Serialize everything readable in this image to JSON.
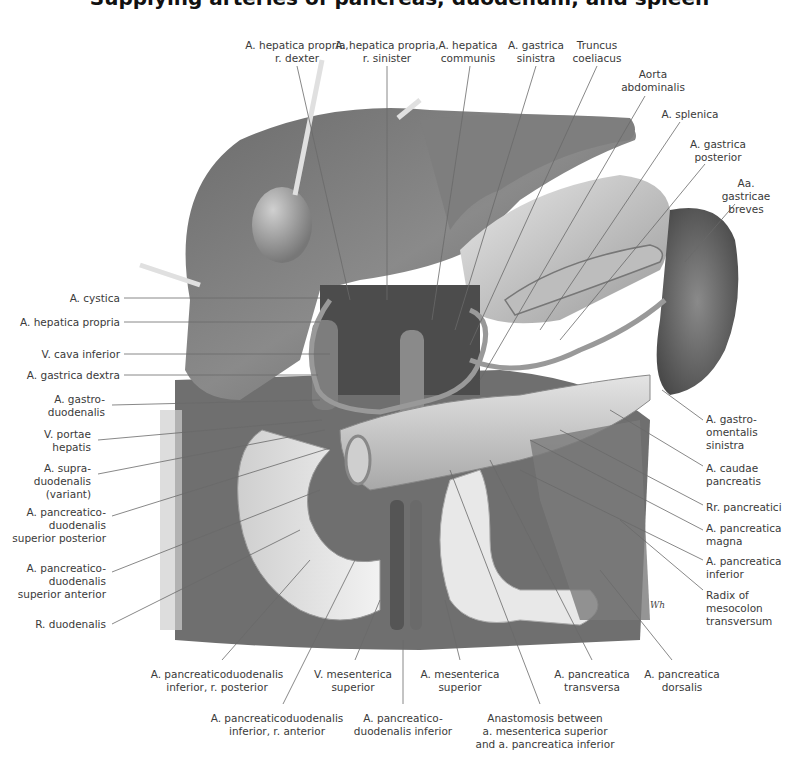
{
  "figure": {
    "title_cutoff": "Supplying arteries of pancreas, duodenum, and spleen",
    "signature": "Wh"
  },
  "labels": {
    "top": [
      {
        "id": "hep-prop-dexter",
        "text": "A. hepatica propria,\nr. dexter",
        "x": 297,
        "y": 39
      },
      {
        "id": "hep-prop-sinister",
        "text": "A. hepatica propria,\nr. sinister",
        "x": 387,
        "y": 39
      },
      {
        "id": "hep-communis",
        "text": "A. hepatica\ncommunis",
        "x": 468,
        "y": 39
      },
      {
        "id": "gastrica-sinistra",
        "text": "A. gastrica\nsinistra",
        "x": 536,
        "y": 39
      },
      {
        "id": "truncus-coeliacus",
        "text": "Truncus\ncoeliacus",
        "x": 597,
        "y": 39
      },
      {
        "id": "aorta-abdominalis",
        "text": "Aorta\nabdominalis",
        "x": 653,
        "y": 68
      },
      {
        "id": "a-splenica",
        "text": "A. splenica",
        "x": 690,
        "y": 108
      },
      {
        "id": "gastrica-posterior",
        "text": "A. gastrica\nposterior",
        "x": 718,
        "y": 138
      },
      {
        "id": "gastricae-breves",
        "text": "Aa. gastricae\nbreves",
        "x": 746,
        "y": 177
      }
    ],
    "left": [
      {
        "id": "a-cystica",
        "text": "A. cystica",
        "y": 292
      },
      {
        "id": "hep-propria",
        "text": "A. hepatica propria",
        "y": 316
      },
      {
        "id": "v-cava-inferior",
        "text": "V. cava inferior",
        "y": 348
      },
      {
        "id": "gastrica-dextra",
        "text": "A. gastrica dextra",
        "y": 369
      },
      {
        "id": "gastroduodenalis",
        "text": "A. gastro-\nduodenalis",
        "y": 400
      },
      {
        "id": "v-portae",
        "text": "V. portae\nhepatis",
        "y": 434
      },
      {
        "id": "supraduodenalis",
        "text": "A. supra-\nduodenalis\n(variant)",
        "y": 468
      },
      {
        "id": "pd-sup-posterior",
        "text": "A. pancreatico-\nduodenalis\nsuperior posterior",
        "y": 510
      },
      {
        "id": "pd-sup-anterior",
        "text": "A. pancreatico-\nduodenalis\nsuperior anterior",
        "y": 566
      },
      {
        "id": "r-duodenalis",
        "text": "R. duodenalis",
        "y": 620
      }
    ],
    "right": [
      {
        "id": "gastroomentalis-sinistra",
        "text": "A. gastro-\nomentalis\nsinistra",
        "y": 418
      },
      {
        "id": "caudae-pancreatis",
        "text": "A. caudae\npancreatis",
        "y": 466
      },
      {
        "id": "rr-pancreatici",
        "text": "Rr. pancreatici",
        "y": 503
      },
      {
        "id": "pancreatica-magna",
        "text": "A. pancreatica\nmagna",
        "y": 526
      },
      {
        "id": "pancreatica-inferior",
        "text": "A. pancreatica\ninferior",
        "y": 558
      },
      {
        "id": "radix-mesocolon",
        "text": "Radix of\nmesocolon\ntransversum",
        "y": 589
      }
    ],
    "bottom": [
      {
        "id": "pd-inf-posterior",
        "text": "A. pancreaticoduodenalis\ninferior, r. posterior",
        "x": 217,
        "y": 668
      },
      {
        "id": "v-mes-superior",
        "text": "V. mesenterica\nsuperior",
        "x": 353,
        "y": 668
      },
      {
        "id": "a-mes-superior",
        "text": "A. mesenterica\nsuperior",
        "x": 460,
        "y": 668
      },
      {
        "id": "pancreatica-transversa",
        "text": "A. pancreatica\ntransversa",
        "x": 592,
        "y": 668
      },
      {
        "id": "pancreatica-dorsalis",
        "text": "A. pancreatica\ndorsalis",
        "x": 682,
        "y": 668
      },
      {
        "id": "pd-inf-anterior",
        "text": "A. pancreaticoduodenalis\ninferior, r. anterior",
        "x": 277,
        "y": 712
      },
      {
        "id": "pd-inferior",
        "text": "A. pancreatico-\nduodenalis inferior",
        "x": 403,
        "y": 712
      },
      {
        "id": "anastomosis",
        "text": "Anastomosis between\na. mesenterica superior\nand a. pancreatica inferior",
        "x": 545,
        "y": 712
      }
    ]
  },
  "colors": {
    "label_text": "#3a3a3a",
    "leader_line": "#6a6a6a",
    "organ_dark": "#5a5a5a",
    "organ_mid": "#8c8c8c",
    "organ_light": "#d6d6d6",
    "background": "#ffffff"
  }
}
